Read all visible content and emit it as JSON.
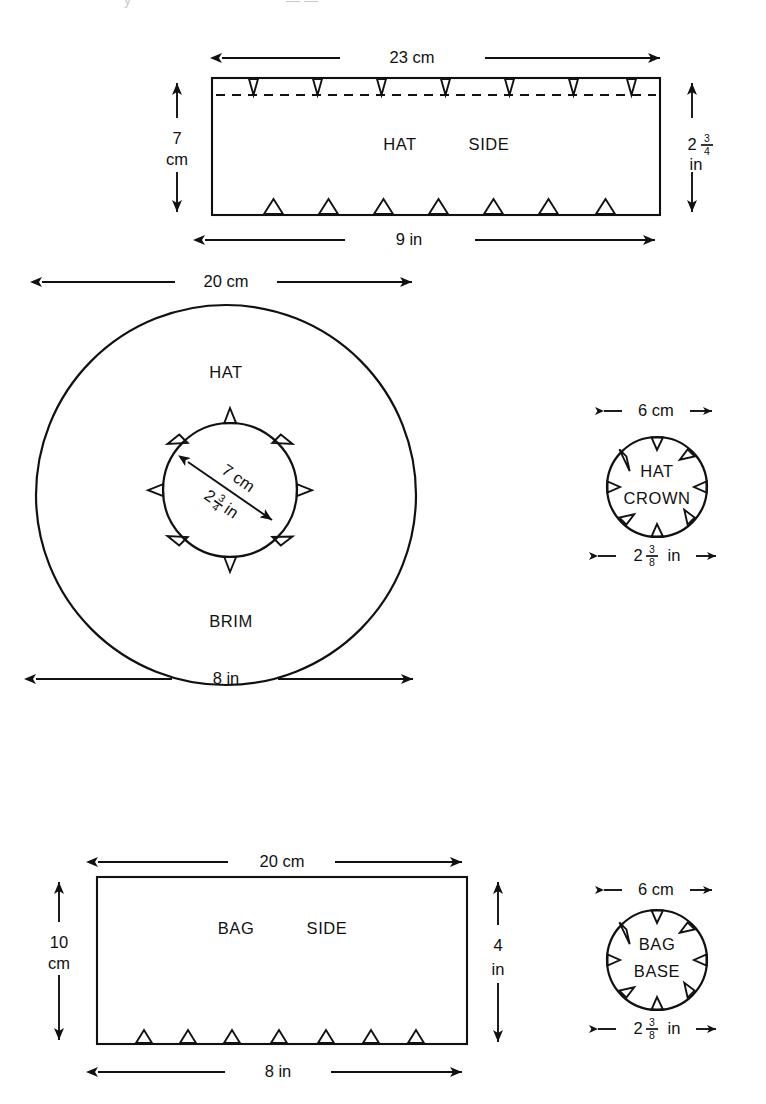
{
  "document": {
    "type": "sewing-pattern-diagram",
    "title_fragment": "",
    "background_color": "#ffffff",
    "line_color": "#111111"
  },
  "pieces": [
    {
      "id": "hat-side",
      "label_words": [
        "HAT",
        "SIDE"
      ],
      "shape": "rectangle",
      "dimensions": {
        "top": "23 cm",
        "bottom": "9 in",
        "left_value": "7",
        "left_unit": "cm",
        "right_whole": "2",
        "right_num": "3",
        "right_den": "4",
        "right_unit": "in"
      },
      "notches": {
        "top_count": 7,
        "bottom_count": 7,
        "top_direction": "down",
        "bottom_direction": "up",
        "seam_line": "dashed"
      }
    },
    {
      "id": "hat-brim",
      "label_words": [
        "HAT",
        "BRIM"
      ],
      "shape": "annulus",
      "dimensions": {
        "top": "20 cm",
        "bottom": "8 in",
        "inner_cm": "7 cm",
        "inner_in_whole": "2",
        "inner_in_num": "3",
        "inner_in_den": "4",
        "inner_in_unit": "in"
      },
      "notches": {
        "inner_count": 8,
        "inner_direction": "outward"
      }
    },
    {
      "id": "hat-crown",
      "label_words": [
        "HAT",
        "CROWN"
      ],
      "shape": "circle",
      "dimensions": {
        "top": "6 cm",
        "bottom_whole": "2",
        "bottom_num": "3",
        "bottom_den": "8",
        "bottom_unit": "in"
      },
      "notches": {
        "count": 8,
        "direction": "inward"
      }
    },
    {
      "id": "bag-side",
      "label_words": [
        "BAG",
        "SIDE"
      ],
      "shape": "rectangle",
      "dimensions": {
        "top": "20 cm",
        "bottom": "8 in",
        "left_value": "10",
        "left_unit": "cm",
        "right_value": "4",
        "right_unit": "in"
      },
      "notches": {
        "bottom_count": 7,
        "bottom_direction": "up"
      }
    },
    {
      "id": "bag-base",
      "label_words": [
        "BAG",
        "BASE"
      ],
      "shape": "circle",
      "dimensions": {
        "top": "6 cm",
        "bottom_whole": "2",
        "bottom_num": "3",
        "bottom_den": "8",
        "bottom_unit": "in"
      },
      "notches": {
        "count": 8,
        "direction": "inward"
      }
    }
  ],
  "labels": {
    "hat_side_word1": "HAT",
    "hat_side_word2": "SIDE",
    "hat_side_top_dim": "23 cm",
    "hat_side_bottom_dim": "9 in",
    "hat_side_left_num": "7",
    "hat_side_left_unit": "cm",
    "hat_side_right_whole": "2",
    "hat_side_right_num": "3",
    "hat_side_right_den": "4",
    "hat_side_right_unit": "in",
    "brim_top_dim": "20 cm",
    "brim_bottom_dim": "8 in",
    "brim_word1": "HAT",
    "brim_word2": "BRIM",
    "brim_inner_cm": "7 cm",
    "brim_inner_whole": "2",
    "brim_inner_num": "3",
    "brim_inner_den": "4",
    "brim_inner_unit": "in",
    "crown_top_dim": "6 cm",
    "crown_word1": "HAT",
    "crown_word2": "CROWN",
    "crown_bottom_whole": "2",
    "crown_bottom_num": "3",
    "crown_bottom_den": "8",
    "crown_bottom_unit": "in",
    "bag_side_word1": "BAG",
    "bag_side_word2": "SIDE",
    "bag_side_top_dim": "20 cm",
    "bag_side_bottom_dim": "8 in",
    "bag_side_left_num": "10",
    "bag_side_left_unit": "cm",
    "bag_side_right_num": "4",
    "bag_side_right_unit": "in",
    "bag_base_top_dim": "6 cm",
    "bag_base_word1": "BAG",
    "bag_base_word2": "BASE",
    "bag_base_bottom_whole": "2",
    "bag_base_bottom_num": "3",
    "bag_base_bottom_den": "8",
    "bag_base_bottom_unit": "in"
  }
}
